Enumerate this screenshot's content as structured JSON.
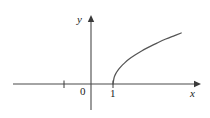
{
  "figure": {
    "background_color": "#ffffff",
    "stroke_color": "#555555",
    "axis_color": "#4a4a4a",
    "text_color": "#1b1b1b"
  },
  "axes": {
    "x_axis_label": "x",
    "y_axis_label": "y",
    "origin_label": "0",
    "x_tick_labels": [
      "1"
    ],
    "x_axis_has_arrow": true,
    "y_axis_has_arrow": true
  },
  "chart_data": {
    "type": "line",
    "title": "",
    "subtitle": "",
    "xlabel": "x",
    "ylabel": "y",
    "grid": false,
    "legend": null,
    "annotations": [
      "0",
      "1"
    ],
    "xlim": [
      -3.2,
      4.3
    ],
    "ylim": [
      -1.1,
      2.6
    ],
    "x_ticks": [
      -1,
      1
    ],
    "x_tick_labels": [
      "",
      "1"
    ],
    "y_ticks": [],
    "y_tick_labels": [],
    "series": [
      {
        "name": "y = sqrt(x - 1)",
        "x": [
          1.0,
          1.05,
          1.12,
          1.22,
          1.35,
          1.52,
          1.75,
          2.0,
          2.3,
          2.65,
          3.0,
          3.4,
          3.8,
          4.1
        ],
        "y": [
          0.0,
          0.22,
          0.35,
          0.47,
          0.59,
          0.72,
          0.87,
          1.0,
          1.14,
          1.28,
          1.41,
          1.55,
          1.67,
          1.76
        ]
      }
    ]
  }
}
